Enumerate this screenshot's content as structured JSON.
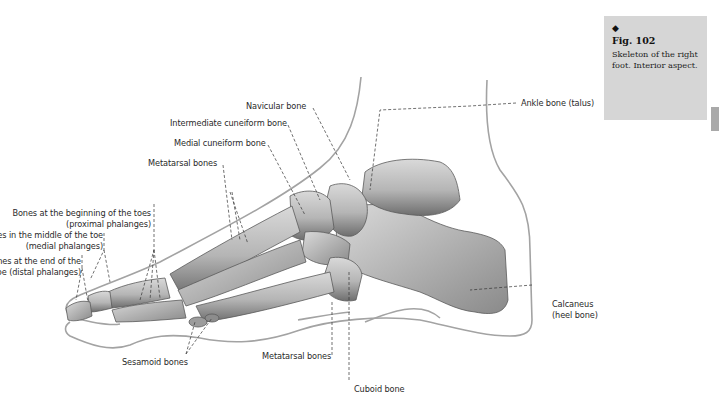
{
  "caption": {
    "marker": "◆",
    "figure_number": "Fig. 102",
    "description": "Skeleton of the right foot. Interior aspect."
  },
  "labels": {
    "navicular": "Navicular bone",
    "intermediate_cuneiform": "Intermediate cuneiform bone",
    "medial_cuneiform": "Medial cuneiform bone",
    "metatarsal_top": "Metatarsal bones",
    "proximal_line1": "Bones at the beginning of the toes",
    "proximal_line2": "(proximal phalanges)",
    "medial_line1": "Bones in the middle of the toe",
    "medial_line2": "(medial phalanges)",
    "distal_line1": "Bones at the end of the",
    "distal_line2": "toe (distal phalanges)",
    "talus": "Ankle bone (talus)",
    "calcaneus_line1": "Calcaneus",
    "calcaneus_line2": "(heel bone)",
    "sesamoid": "Sesamoid bones",
    "metatarsal_bottom": "Metatarsal bones",
    "cuboid": "Cuboid bone"
  },
  "colors": {
    "caption_bg": "#d6d6d6",
    "side_tab": "#a9a9a9",
    "skin_outline": "#9a9a9a",
    "bone_fill": "#bdbdbd",
    "bone_shadow": "#6f6f6f",
    "leader_line": "#333333"
  }
}
